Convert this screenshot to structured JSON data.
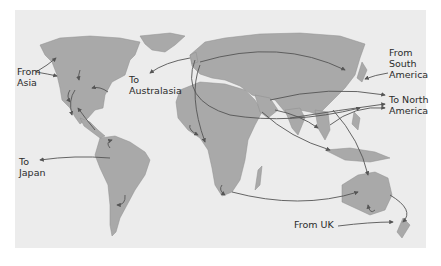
{
  "map": {
    "type": "world-migration-flows",
    "colors": {
      "ocean": "#ececec",
      "land": "#a9a9a9",
      "coast": "#8f8f8f",
      "arrow": "#555555",
      "text": "#2b2b2b"
    },
    "labels": [
      {
        "id": "from-asia",
        "lines": [
          "From",
          "Asia"
        ],
        "x": 17,
        "y": 66
      },
      {
        "id": "to-australasia",
        "lines": [
          "To",
          "Australasia"
        ],
        "x": 129,
        "y": 74
      },
      {
        "id": "from-south-america",
        "lines": [
          "From",
          "South",
          "America"
        ],
        "x": 389,
        "y": 47
      },
      {
        "id": "to-north-america",
        "lines": [
          "To North",
          "America"
        ],
        "x": 389,
        "y": 94
      },
      {
        "id": "to-japan",
        "lines": [
          "To",
          "Japan"
        ],
        "x": 19,
        "y": 156
      },
      {
        "id": "from-uk",
        "lines": [
          "From UK"
        ],
        "x": 294,
        "y": 219
      }
    ]
  }
}
